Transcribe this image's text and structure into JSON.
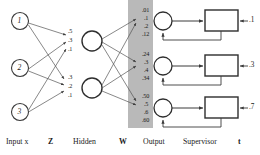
{
  "diagram": {
    "band_color": "#b9b9b9",
    "stroke_color": "#3a3a3a",
    "input_nodes": [
      {
        "label": "1"
      },
      {
        "label": "2"
      },
      {
        "label": "3"
      }
    ],
    "hidden_nodes": [
      {
        "weights": [
          ".5",
          ".3",
          ".1"
        ]
      },
      {
        "weights": [
          ".3",
          ".2",
          ".1"
        ]
      }
    ],
    "output_nodes": [
      {
        "weights": [
          ".01",
          ".1",
          ".2",
          ".12"
        ]
      },
      {
        "weights": [
          ".24",
          ".3",
          ".4",
          ".34"
        ]
      },
      {
        "weights": [
          ".50",
          ".5",
          ".6",
          ".60"
        ]
      }
    ],
    "targets": [
      ".1",
      ".3",
      ".7"
    ],
    "axis_labels": [
      {
        "text": "Input x",
        "bold": false
      },
      {
        "text": "Z",
        "bold": true
      },
      {
        "text": "Hidden",
        "bold": false
      },
      {
        "text": "W",
        "bold": true
      },
      {
        "text": "Output",
        "bold": false
      },
      {
        "text": "Supervisor",
        "bold": false
      },
      {
        "text": "t",
        "bold": true
      }
    ]
  }
}
